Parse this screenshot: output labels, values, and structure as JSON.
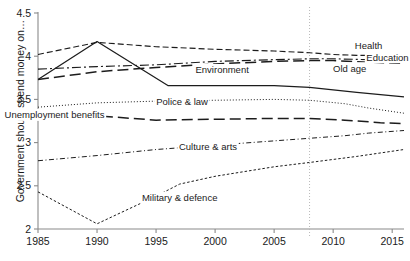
{
  "chart_data": {
    "type": "line",
    "title": "",
    "xlabel": "",
    "ylabel": "Government should spend money on…",
    "xlim": [
      1985,
      2016
    ],
    "ylim": [
      2,
      4.5
    ],
    "xticks": [
      1985,
      1990,
      1995,
      2000,
      2005,
      2010,
      2015
    ],
    "xticklabels": [
      "1985",
      "1990",
      "1995",
      "2000",
      "2005",
      "2010",
      "2015"
    ],
    "yticks": [
      2,
      2.5,
      3,
      3.5,
      4,
      4.5
    ],
    "yticklabels": [
      "2",
      "2.5",
      "3",
      "3.5",
      "4",
      "4.5"
    ],
    "grid": false,
    "legend_position": "inline-annotations",
    "annotations": [
      {
        "text": "Health",
        "x": 2013.0,
        "y": 4.08
      },
      {
        "text": "Education",
        "x": 2014.6,
        "y": 3.95
      },
      {
        "text": "Old age",
        "x": 2011.4,
        "y": 3.82
      },
      {
        "text": "Environment",
        "x": 2000.6,
        "y": 3.8
      },
      {
        "text": "Police & law",
        "x": 1997.2,
        "y": 3.43
      },
      {
        "text": "Unemployment benefits",
        "x": 1986.4,
        "y": 3.28
      },
      {
        "text": "Culture & arts",
        "x": 1999.4,
        "y": 2.92
      },
      {
        "text": "Military & defence",
        "x": 1997.0,
        "y": 2.32
      }
    ],
    "vertical_marker": {
      "x": 2008,
      "style": "dotted",
      "color": "#b9b9b9"
    },
    "series": [
      {
        "name": "Health",
        "style": "dashed",
        "x": [
          1985,
          1990,
          1995,
          2000,
          2005,
          2008,
          2010,
          2012,
          2014,
          2016
        ],
        "values": [
          4.02,
          4.16,
          4.11,
          4.08,
          4.06,
          4.04,
          4.02,
          4.01,
          4.01,
          4.02
        ]
      },
      {
        "name": "Education",
        "style": "dash-dot",
        "x": [
          1985,
          1990,
          1995,
          2000,
          2005,
          2008,
          2010,
          2013,
          2016
        ],
        "values": [
          3.85,
          3.88,
          3.9,
          3.94,
          3.96,
          3.97,
          3.97,
          3.96,
          3.96
        ]
      },
      {
        "name": "Old age",
        "style": "long-dash",
        "x": [
          1985,
          1990,
          1995,
          2000,
          2005,
          2008,
          2010,
          2013,
          2016
        ],
        "values": [
          3.73,
          3.82,
          3.87,
          3.91,
          3.94,
          3.95,
          3.95,
          3.93,
          3.92
        ]
      },
      {
        "name": "Environment",
        "style": "solid",
        "x": [
          1985,
          1990,
          1996,
          2005,
          2008,
          2012,
          2016
        ],
        "values": [
          3.73,
          4.17,
          3.66,
          3.66,
          3.64,
          3.58,
          3.53
        ]
      },
      {
        "name": "Police & law",
        "style": "dotted",
        "x": [
          1985,
          1990,
          1995,
          2000,
          2005,
          2008,
          2011,
          2013,
          2016
        ],
        "values": [
          3.41,
          3.46,
          3.48,
          3.49,
          3.5,
          3.49,
          3.45,
          3.4,
          3.34
        ]
      },
      {
        "name": "Unemployment benefits",
        "style": "long-dash",
        "x": [
          1985,
          1990,
          1995,
          2000,
          2005,
          2008,
          2011,
          2014,
          2016
        ],
        "values": [
          3.35,
          3.31,
          3.26,
          3.27,
          3.28,
          3.28,
          3.26,
          3.23,
          3.22
        ]
      },
      {
        "name": "Culture & arts",
        "style": "dash-dot-fine",
        "x": [
          1985,
          1990,
          1995,
          2000,
          2005,
          2008,
          2011,
          2013,
          2016
        ],
        "values": [
          2.79,
          2.85,
          2.92,
          2.97,
          3.02,
          3.05,
          3.08,
          3.11,
          3.14
        ]
      },
      {
        "name": "Military & defence",
        "style": "dotted-dense",
        "x": [
          1985,
          1990,
          1995,
          1997,
          2000,
          2005,
          2008,
          2012,
          2016
        ],
        "values": [
          2.43,
          2.06,
          2.38,
          2.52,
          2.61,
          2.72,
          2.77,
          2.84,
          2.92
        ]
      }
    ]
  }
}
